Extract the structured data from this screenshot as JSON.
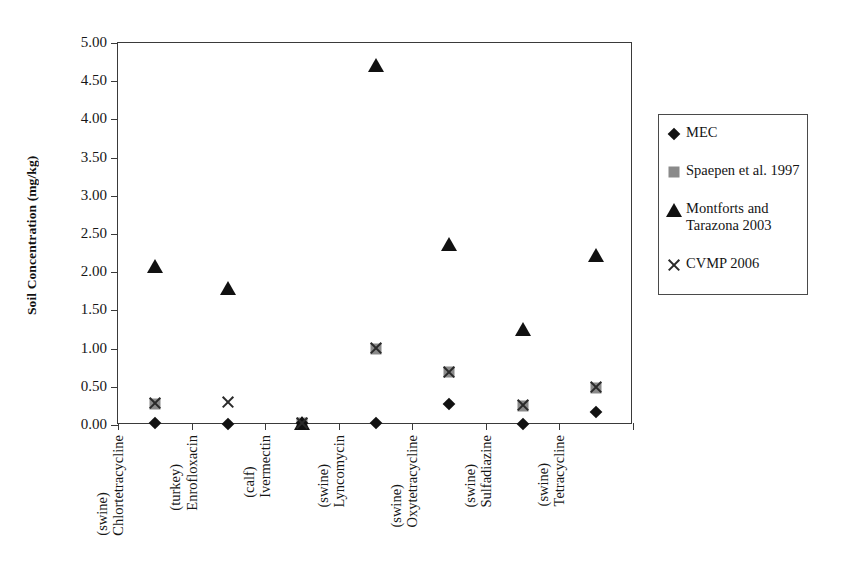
{
  "chart_data": {
    "type": "scatter",
    "title": "",
    "xlabel": "",
    "ylabel": "Soil Concentration (mg/kg)",
    "ylim": [
      0.0,
      5.0
    ],
    "ytick_step": 0.5,
    "grid": false,
    "legend_position": "right",
    "ytick_labels": [
      "0.00",
      "0.50",
      "1.00",
      "1.50",
      "2.00",
      "2.50",
      "3.00",
      "3.50",
      "4.00",
      "4.50",
      "5.00"
    ],
    "categories": [
      "Chlortetracycline (swine)",
      "Enrofloxacin (turkey)",
      "Ivermectin (calf)",
      "Lyncomycin (swine)",
      "Oxytetracycline (swine)",
      "Sulfadiazine (swine)",
      "Tetracycline (swine)"
    ],
    "category_lines": [
      [
        "Chlortetracycline",
        "(swine)"
      ],
      [
        "Enrofloxacin",
        "(turkey)"
      ],
      [
        "Ivermectin",
        "(calf)"
      ],
      [
        "Lyncomycin",
        "(swine)"
      ],
      [
        "Oxytetracycline",
        "(swine)"
      ],
      [
        "Sulfadiazine",
        "(swine)"
      ],
      [
        "Tetracycline",
        "(swine)"
      ]
    ],
    "series": [
      {
        "name": "MEC",
        "marker": "diamond",
        "color": "#111111",
        "values": [
          0.03,
          0.01,
          0.02,
          0.02,
          0.28,
          0.01,
          0.17
        ]
      },
      {
        "name": "Spaepen et al. 1997",
        "marker": "square",
        "color": "#8a8a8a",
        "values": [
          0.28,
          null,
          0.02,
          1.0,
          0.69,
          0.25,
          0.49
        ]
      },
      {
        "name": "Montforts and Tarazona 2003",
        "marker": "triangle",
        "color": "#111111",
        "values": [
          2.08,
          1.79,
          0.02,
          4.71,
          2.37,
          1.26,
          2.23
        ]
      },
      {
        "name": "CVMP 2006",
        "marker": "cross",
        "color": "#2a2a2a",
        "values": [
          0.29,
          0.3,
          0.02,
          1.01,
          0.7,
          0.26,
          0.5
        ]
      }
    ]
  },
  "legend": {
    "entries": [
      {
        "label": "MEC",
        "marker": "diamond"
      },
      {
        "label": "Spaepen et al. 1997",
        "marker": "square"
      },
      {
        "label": "Montforts and Tarazona 2003",
        "marker": "triangle"
      },
      {
        "label": "CVMP 2006",
        "marker": "cross"
      }
    ]
  }
}
